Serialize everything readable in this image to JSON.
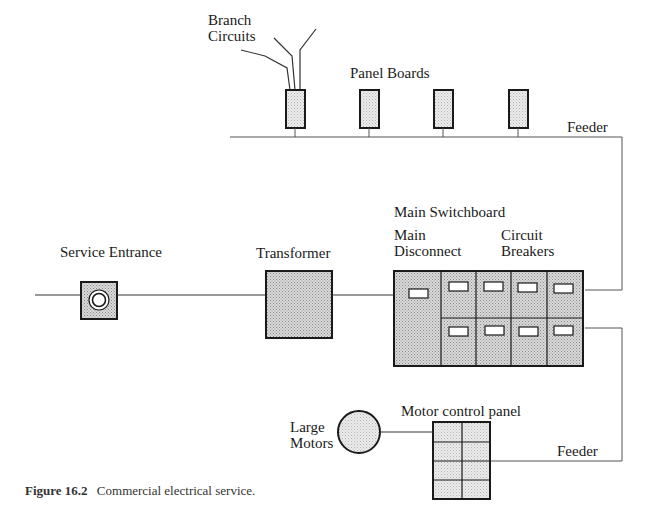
{
  "figure": {
    "caption_label": "Figure 16.2",
    "caption_text": "Commercial electrical service."
  },
  "labels": {
    "branch_circuits_line1": "Branch",
    "branch_circuits_line2": "Circuits",
    "panel_boards": "Panel Boards",
    "feeder_top": "Feeder",
    "main_switchboard": "Main Switchboard",
    "main_disconnect_line1": "Main",
    "main_disconnect_line2": "Disconnect",
    "circuit_breakers_line1": "Circuit",
    "circuit_breakers_line2": "Breakers",
    "service_entrance": "Service Entrance",
    "transformer": "Transformer",
    "motor_control_panel": "Motor control panel",
    "large_motors_line1": "Large",
    "large_motors_line2": "Motors",
    "feeder_bottom": "Feeder"
  },
  "components": {
    "panel_boards_count": 4,
    "circuit_breakers_count": 8,
    "motor_control_cells": 8,
    "branch_circuit_wires": 3
  },
  "colors": {
    "fill_gray": "#c8c8c8",
    "fill_light": "#e4e4e4",
    "line": "#1a1a1a"
  }
}
